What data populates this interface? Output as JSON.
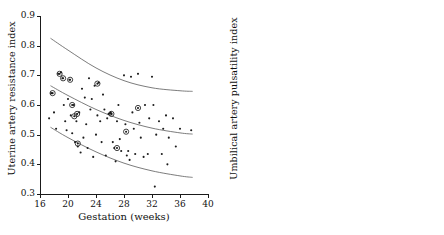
{
  "chart_data": [
    {
      "type": "scatter",
      "panel": "left",
      "title": "",
      "xlabel": "Gestation (weeks)",
      "ylabel": "Uterine artery resistance index",
      "xlim": [
        16,
        40
      ],
      "ylim": [
        0.3,
        0.9
      ],
      "xticks": [
        16,
        20,
        24,
        28,
        32,
        36,
        40
      ],
      "yticks": [
        0.3,
        0.4,
        0.5,
        0.6,
        0.7,
        0.8,
        0.9
      ],
      "xtick_labels": [
        "16",
        "20",
        "24",
        "28",
        "32",
        "36",
        "40"
      ],
      "ytick_labels": [
        "0.3",
        "0.4",
        "0.5",
        "0.6",
        "0.7",
        "0.8",
        "0.9"
      ],
      "grid": false,
      "legend": "none",
      "series": [
        {
          "name": "plain points",
          "marker": "dot",
          "points": [
            [
              17.3,
              0.555
            ],
            [
              17.6,
              0.64
            ],
            [
              18.0,
              0.575
            ],
            [
              18.3,
              0.52
            ],
            [
              18.6,
              0.705
            ],
            [
              19.0,
              0.71
            ],
            [
              19.2,
              0.69
            ],
            [
              19.4,
              0.6
            ],
            [
              19.6,
              0.545
            ],
            [
              19.8,
              0.515
            ],
            [
              20.0,
              0.62
            ],
            [
              20.2,
              0.685
            ],
            [
              20.4,
              0.565
            ],
            [
              20.6,
              0.505
            ],
            [
              20.8,
              0.6
            ],
            [
              21.0,
              0.475
            ],
            [
              21.2,
              0.545
            ],
            [
              21.4,
              0.46
            ],
            [
              21.6,
              0.575
            ],
            [
              21.8,
              0.44
            ],
            [
              22.0,
              0.655
            ],
            [
              22.2,
              0.49
            ],
            [
              22.4,
              0.625
            ],
            [
              22.6,
              0.535
            ],
            [
              22.8,
              0.455
            ],
            [
              23.0,
              0.69
            ],
            [
              23.2,
              0.585
            ],
            [
              23.4,
              0.62
            ],
            [
              23.6,
              0.425
            ],
            [
              23.8,
              0.665
            ],
            [
              24.0,
              0.5
            ],
            [
              24.2,
              0.565
            ],
            [
              24.4,
              0.675
            ],
            [
              24.6,
              0.545
            ],
            [
              24.8,
              0.475
            ],
            [
              25.0,
              0.635
            ],
            [
              25.2,
              0.585
            ],
            [
              25.4,
              0.43
            ],
            [
              25.6,
              0.555
            ],
            [
              25.8,
              0.57
            ],
            [
              26.0,
              0.572
            ],
            [
              26.1,
              0.575
            ],
            [
              26.2,
              0.57
            ],
            [
              26.4,
              0.475
            ],
            [
              26.6,
              0.455
            ],
            [
              26.8,
              0.41
            ],
            [
              27.0,
              0.545
            ],
            [
              27.2,
              0.6
            ],
            [
              27.4,
              0.485
            ],
            [
              27.6,
              0.445
            ],
            [
              28.0,
              0.7
            ],
            [
              28.2,
              0.535
            ],
            [
              28.4,
              0.43
            ],
            [
              28.6,
              0.445
            ],
            [
              28.8,
              0.415
            ],
            [
              29.0,
              0.695
            ],
            [
              29.2,
              0.575
            ],
            [
              29.4,
              0.52
            ],
            [
              29.6,
              0.435
            ],
            [
              30.0,
              0.705
            ],
            [
              30.2,
              0.54
            ],
            [
              30.4,
              0.49
            ],
            [
              30.8,
              0.425
            ],
            [
              31.0,
              0.6
            ],
            [
              31.4,
              0.435
            ],
            [
              31.6,
              0.555
            ],
            [
              32.0,
              0.695
            ],
            [
              32.2,
              0.6
            ],
            [
              32.4,
              0.325
            ],
            [
              32.6,
              0.5
            ],
            [
              33.0,
              0.545
            ],
            [
              33.4,
              0.435
            ],
            [
              33.6,
              0.52
            ],
            [
              34.0,
              0.565
            ],
            [
              34.2,
              0.4
            ],
            [
              34.4,
              0.49
            ],
            [
              35.0,
              0.555
            ],
            [
              35.4,
              0.46
            ],
            [
              36.0,
              0.52
            ],
            [
              37.6,
              0.515
            ]
          ]
        },
        {
          "name": "circled points",
          "marker": "circled-dot",
          "points": [
            [
              18.8,
              0.705
            ],
            [
              19.3,
              0.69
            ],
            [
              20.3,
              0.685
            ],
            [
              20.6,
              0.6
            ],
            [
              20.9,
              0.562
            ],
            [
              21.3,
              0.57
            ],
            [
              21.4,
              0.47
            ],
            [
              17.8,
              0.64
            ],
            [
              24.2,
              0.672
            ],
            [
              26.2,
              0.57
            ],
            [
              27.0,
              0.455
            ],
            [
              28.3,
              0.51
            ],
            [
              30.0,
              0.59
            ]
          ]
        }
      ],
      "reference_lines": [
        {
          "name": "upper percentile",
          "points": [
            [
              17.5,
              0.825
            ],
            [
              20,
              0.785
            ],
            [
              24,
              0.725
            ],
            [
              28,
              0.682
            ],
            [
              32,
              0.658
            ],
            [
              36,
              0.648
            ],
            [
              37.8,
              0.646
            ]
          ]
        },
        {
          "name": "median percentile",
          "points": [
            [
              17.5,
              0.665
            ],
            [
              20,
              0.632
            ],
            [
              24,
              0.585
            ],
            [
              28,
              0.548
            ],
            [
              32,
              0.522
            ],
            [
              36,
              0.506
            ],
            [
              37.8,
              0.502
            ]
          ]
        },
        {
          "name": "lower percentile",
          "points": [
            [
              17.5,
              0.525
            ],
            [
              20,
              0.49
            ],
            [
              24,
              0.442
            ],
            [
              28,
              0.404
            ],
            [
              32,
              0.378
            ],
            [
              36,
              0.361
            ],
            [
              37.8,
              0.356
            ]
          ]
        }
      ]
    },
    {
      "type": "scatter",
      "panel": "right",
      "title": "",
      "xlabel": "Gestation (weeks)",
      "ylabel": "Umbilical artery pulsatility index",
      "xlim": [
        16,
        40
      ],
      "ylim": [
        0.4,
        1.8
      ],
      "xticks": [
        16,
        20,
        24,
        28,
        32,
        36,
        40
      ],
      "yticks": [
        0.4,
        0.6,
        0.8,
        1.0,
        1.2,
        1.4,
        1.6,
        1.8
      ],
      "xtick_labels": [
        "16",
        "20",
        "24",
        "28",
        "32",
        "36",
        "40"
      ],
      "ytick_labels": [
        "0.4",
        "0.6",
        "0.8",
        "1.0",
        "1.2",
        "1.4",
        "1.6",
        "1.8"
      ],
      "grid": false,
      "legend": "none",
      "series": [
        {
          "name": "plain points",
          "marker": "dot",
          "points": [
            [
              16.6,
              1.58
            ],
            [
              16.8,
              1.255
            ],
            [
              18.2,
              1.6
            ],
            [
              18.6,
              1.535
            ],
            [
              19.0,
              1.46
            ],
            [
              19.2,
              1.32
            ],
            [
              19.4,
              1.22
            ],
            [
              19.6,
              1.175
            ],
            [
              19.8,
              1.085
            ],
            [
              20.0,
              1.405
            ],
            [
              20.2,
              1.27
            ],
            [
              20.4,
              1.345
            ],
            [
              20.6,
              1.215
            ],
            [
              20.8,
              1.03
            ],
            [
              21.0,
              1.59
            ],
            [
              21.2,
              1.355
            ],
            [
              21.4,
              1.3
            ],
            [
              21.6,
              1.245
            ],
            [
              21.8,
              1.17
            ],
            [
              22.0,
              1.055
            ],
            [
              22.2,
              1.46
            ],
            [
              22.4,
              1.175
            ],
            [
              22.6,
              1.02
            ],
            [
              22.8,
              1.225
            ],
            [
              23.0,
              1.45
            ],
            [
              23.2,
              0.975
            ],
            [
              23.4,
              1.125
            ],
            [
              23.6,
              1.32
            ],
            [
              23.8,
              1.39
            ],
            [
              24.0,
              1.305
            ],
            [
              24.2,
              1.155
            ],
            [
              24.4,
              0.915
            ],
            [
              24.6,
              1.345
            ],
            [
              24.8,
              1.075
            ],
            [
              25.0,
              1.25
            ],
            [
              25.2,
              1.005
            ],
            [
              25.4,
              1.4
            ],
            [
              25.6,
              1.15
            ],
            [
              25.8,
              0.945
            ],
            [
              26.0,
              1.125
            ],
            [
              26.2,
              1.335
            ],
            [
              26.4,
              1.045
            ],
            [
              26.6,
              1.215
            ],
            [
              26.8,
              0.98
            ],
            [
              27.0,
              1.3
            ],
            [
              27.2,
              1.095
            ],
            [
              27.4,
              0.925
            ],
            [
              27.6,
              1.255
            ],
            [
              27.8,
              1.055
            ],
            [
              28.0,
              1.36
            ],
            [
              28.2,
              1.145
            ],
            [
              28.4,
              0.985
            ],
            [
              28.6,
              1.22
            ],
            [
              28.8,
              0.9
            ],
            [
              29.0,
              1.285
            ],
            [
              29.2,
              1.06
            ],
            [
              29.4,
              0.955
            ],
            [
              29.6,
              1.195
            ],
            [
              29.8,
              0.78
            ],
            [
              30.0,
              1.3
            ],
            [
              30.2,
              1.095
            ],
            [
              30.4,
              0.935
            ],
            [
              30.6,
              1.165
            ],
            [
              30.8,
              1.015
            ],
            [
              31.0,
              1.225
            ],
            [
              31.2,
              0.885
            ],
            [
              31.4,
              1.08
            ],
            [
              31.6,
              0.955
            ],
            [
              32.0,
              1.135
            ],
            [
              32.2,
              0.875
            ],
            [
              32.4,
              1.045
            ],
            [
              32.6,
              0.68
            ],
            [
              33.0,
              1.09
            ],
            [
              33.2,
              0.8
            ],
            [
              33.6,
              0.97
            ],
            [
              34.0,
              1.045
            ],
            [
              34.2,
              0.775
            ],
            [
              34.6,
              1.04
            ],
            [
              35.0,
              0.905
            ],
            [
              36.0,
              0.885
            ],
            [
              37.6,
              0.875
            ]
          ]
        },
        {
          "name": "circled points",
          "marker": "circled-dot",
          "points": [
            [
              17.4,
              1.685
            ],
            [
              18.6,
              1.515
            ],
            [
              19.6,
              1.555
            ],
            [
              20.4,
              1.495
            ],
            [
              20.6,
              1.2
            ],
            [
              20.8,
              1.205
            ],
            [
              21.2,
              1.39
            ],
            [
              21.5,
              1.355
            ],
            [
              21.7,
              1.355
            ],
            [
              19.6,
              1.205
            ],
            [
              23.5,
              1.675
            ],
            [
              24.0,
              1.385
            ],
            [
              25.8,
              1.13
            ],
            [
              26.0,
              1.095
            ],
            [
              26.2,
              1.14
            ],
            [
              28.2,
              1.115
            ],
            [
              29.8,
              1.055
            ],
            [
              30.0,
              1.06
            ]
          ]
        }
      ],
      "reference_lines": [
        {
          "name": "upper percentile",
          "points": [
            [
              17.4,
              1.785
            ],
            [
              22,
              1.6
            ],
            [
              28,
              1.355
            ],
            [
              34,
              1.12
            ],
            [
              37.8,
              0.975
            ]
          ]
        },
        {
          "name": "median percentile",
          "points": [
            [
              17.4,
              1.5
            ],
            [
              22,
              1.335
            ],
            [
              28,
              1.12
            ],
            [
              34,
              0.905
            ],
            [
              37.8,
              0.775
            ]
          ]
        },
        {
          "name": "lower percentile",
          "points": [
            [
              17.4,
              1.185
            ],
            [
              22,
              1.035
            ],
            [
              28,
              0.84
            ],
            [
              34,
              0.645
            ],
            [
              37.8,
              0.525
            ]
          ]
        }
      ]
    }
  ],
  "caption": {
    "partial_text": ""
  }
}
